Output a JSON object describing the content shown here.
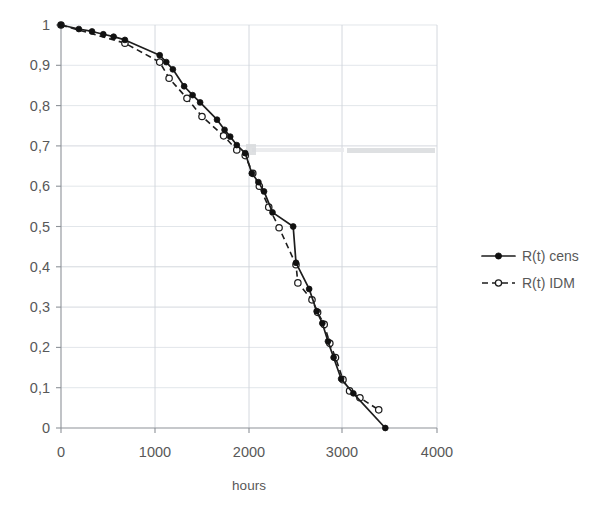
{
  "chart_data": {
    "type": "line",
    "title": "",
    "xlabel": "hours",
    "ylabel": "",
    "xlim": [
      0,
      4000
    ],
    "ylim": [
      0,
      1
    ],
    "grid": true,
    "legend_position": "right",
    "x_ticks": [
      "0",
      "1000",
      "2000",
      "3000",
      "4000"
    ],
    "x_tick_values": [
      0,
      1000,
      2000,
      3000,
      4000
    ],
    "y_ticks": [
      "0",
      "0,1",
      "0,2",
      "0,3",
      "0,4",
      "0,5",
      "0,6",
      "0,7",
      "0,8",
      "0,9",
      "1"
    ],
    "y_tick_values": [
      0,
      0.1,
      0.2,
      0.3,
      0.4,
      0.5,
      0.6,
      0.7,
      0.8,
      0.9,
      1.0
    ],
    "decimal_separator": ",",
    "series": [
      {
        "name": "R(t) cens",
        "style": "solid",
        "marker": "filled-circle",
        "color": "#111111",
        "points": [
          [
            0,
            1.0
          ],
          [
            190,
            0.99
          ],
          [
            330,
            0.984
          ],
          [
            450,
            0.977
          ],
          [
            560,
            0.971
          ],
          [
            680,
            0.963
          ],
          [
            1050,
            0.925
          ],
          [
            1120,
            0.908
          ],
          [
            1190,
            0.89
          ],
          [
            1310,
            0.848
          ],
          [
            1400,
            0.826
          ],
          [
            1480,
            0.808
          ],
          [
            1660,
            0.765
          ],
          [
            1740,
            0.74
          ],
          [
            1800,
            0.723
          ],
          [
            1870,
            0.702
          ],
          [
            1960,
            0.682
          ],
          [
            2030,
            0.632
          ],
          [
            2100,
            0.61
          ],
          [
            2160,
            0.587
          ],
          [
            2250,
            0.535
          ],
          [
            2470,
            0.5
          ],
          [
            2500,
            0.41
          ],
          [
            2640,
            0.345
          ],
          [
            2720,
            0.29
          ],
          [
            2780,
            0.26
          ],
          [
            2840,
            0.215
          ],
          [
            2900,
            0.175
          ],
          [
            2980,
            0.122
          ],
          [
            3110,
            0.086
          ],
          [
            3450,
            0.0
          ]
        ]
      },
      {
        "name": "R(t) IDM",
        "style": "dashed",
        "marker": "open-circle",
        "color": "#1d1d1d",
        "points": [
          [
            0,
            1.0
          ],
          [
            680,
            0.955
          ],
          [
            1050,
            0.908
          ],
          [
            1150,
            0.868
          ],
          [
            1340,
            0.818
          ],
          [
            1500,
            0.773
          ],
          [
            1730,
            0.725
          ],
          [
            1870,
            0.69
          ],
          [
            1960,
            0.676
          ],
          [
            2040,
            0.632
          ],
          [
            2110,
            0.6
          ],
          [
            2210,
            0.548
          ],
          [
            2320,
            0.497
          ],
          [
            2500,
            0.405
          ],
          [
            2520,
            0.36
          ],
          [
            2670,
            0.318
          ],
          [
            2730,
            0.287
          ],
          [
            2800,
            0.257
          ],
          [
            2860,
            0.21
          ],
          [
            2920,
            0.175
          ],
          [
            3000,
            0.12
          ],
          [
            3070,
            0.092
          ],
          [
            3180,
            0.075
          ],
          [
            3380,
            0.045
          ]
        ]
      }
    ],
    "legend": [
      {
        "label": "R(t) cens",
        "style": "solid",
        "marker": "filled-circle"
      },
      {
        "label": "R(t) IDM",
        "style": "dashed",
        "marker": "open-circle"
      }
    ]
  },
  "colors": {
    "series": "#111111",
    "grid": "#cfd4da",
    "axis": "#8d9298",
    "text": "#585858",
    "background": "#ffffff"
  }
}
